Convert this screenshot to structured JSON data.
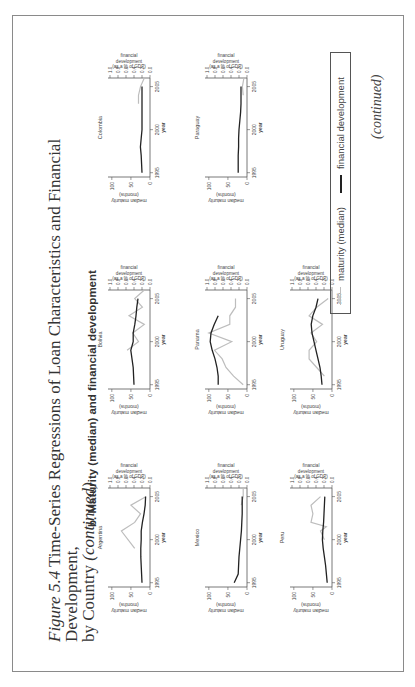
{
  "figure": {
    "title_italic": "Figure 5.4",
    "title_line1": " Time-Series Regressions of Loan Characteristics and Financial Development,",
    "title_line2_prefix": "by Country ",
    "title_line2_italic": "(continued)",
    "subtitle": "b. Maturity (median) and financial development",
    "continued": "(continued)"
  },
  "axes": {
    "left_label_1": "median maturity",
    "left_label_2": "(months)",
    "left_ticks": [
      "0",
      "50",
      "100"
    ],
    "right_label_1": "financial",
    "right_label_2": "development",
    "right_label_3": "(as a % of GDP)",
    "right_ticks": [
      "0.0",
      "0.2",
      "0.4",
      "0.6",
      "0.8",
      "1.0"
    ],
    "x_label": "year",
    "x_ticks": [
      "1995",
      "2000",
      "2005"
    ]
  },
  "legend": {
    "maturity": "maturity (median)",
    "financial": "financial development",
    "maturity_color": "#bdbdbd",
    "financial_color": "#222222"
  },
  "chart_data": {
    "type": "line",
    "xlabel": "year",
    "ylabel_left": "median maturity (months)",
    "ylabel_right": "financial development (as a % of GDP)",
    "xlim": [
      1994.5,
      2006
    ],
    "ylim_left": [
      0,
      110
    ],
    "ylim_right": [
      0,
      1.0
    ],
    "grid": false,
    "legend_position": "bottom",
    "panels": [
      {
        "country": "Argentina",
        "maturity": {
          "x": [
            1999,
            2001,
            2002,
            2003,
            2004,
            2005
          ],
          "y": [
            40,
            75,
            40,
            25,
            50,
            10
          ]
        },
        "financial": {
          "x": [
            1995,
            1996,
            1997,
            1998,
            1999,
            2000,
            2001,
            2002,
            2003,
            2004,
            2005
          ],
          "y": [
            0.2,
            0.21,
            0.22,
            0.23,
            0.23,
            0.22,
            0.22,
            0.19,
            0.15,
            0.12,
            0.11
          ]
        }
      },
      {
        "country": "Bolivia",
        "maturity": {
          "x": [
            1999,
            2000,
            2001,
            2002,
            2003,
            2004,
            2005,
            2006
          ],
          "y": [
            60,
            30,
            45,
            15,
            55,
            20,
            40,
            15
          ]
        },
        "financial": {
          "x": [
            1995,
            1996,
            1997,
            1998,
            1999,
            2000,
            2001,
            2002,
            2003,
            2004,
            2005
          ],
          "y": [
            0.4,
            0.41,
            0.42,
            0.45,
            0.48,
            0.42,
            0.42,
            0.38,
            0.35,
            0.33,
            0.3
          ]
        }
      },
      {
        "country": "Colombia",
        "maturity": {
          "x": [
            2003,
            2004,
            2005,
            2006
          ],
          "y": [
            30,
            30,
            25,
            15
          ]
        },
        "financial": {
          "x": [
            1995,
            1996,
            1997,
            1998,
            1999,
            2000,
            2001,
            2002,
            2003,
            2004,
            2005
          ],
          "y": [
            0.2,
            0.21,
            0.22,
            0.24,
            0.22,
            0.2,
            0.2,
            0.2,
            0.2,
            0.2,
            0.2
          ]
        }
      },
      {
        "country": "Mexico",
        "maturity": {
          "x": [
            2004,
            2005,
            2006
          ],
          "y": [
            15,
            10,
            10
          ]
        },
        "financial": {
          "x": [
            1995,
            1996,
            1997,
            1998,
            1999,
            2000,
            2001,
            2002,
            2003,
            2004,
            2005
          ],
          "y": [
            0.32,
            0.22,
            0.21,
            0.2,
            0.18,
            0.16,
            0.14,
            0.13,
            0.12,
            0.12,
            0.12
          ]
        }
      },
      {
        "country": "Panama",
        "maturity": {
          "x": [
            1995,
            1996,
            1997,
            1998,
            1999,
            2000,
            2001,
            2002,
            2003,
            2004,
            2005
          ],
          "y": [
            10,
            35,
            55,
            65,
            85,
            40,
            100,
            45,
            45,
            30,
            30
          ]
        },
        "financial": {
          "x": [
            1995,
            1996,
            1997,
            1998,
            1999,
            2000,
            2001,
            2002,
            2003
          ],
          "y": [
            0.72,
            0.72,
            0.75,
            0.8,
            0.87,
            0.92,
            0.9,
            0.82,
            0.72
          ]
        }
      },
      {
        "country": "Paraguay",
        "maturity": {
          "x": [
            2004,
            2005,
            2006
          ],
          "y": [
            10,
            12,
            8
          ]
        },
        "financial": {
          "x": [
            1995,
            1996,
            1997,
            1998,
            1999,
            2000,
            2001,
            2002,
            2003,
            2004,
            2005
          ],
          "y": [
            0.22,
            0.22,
            0.22,
            0.21,
            0.21,
            0.2,
            0.18,
            0.16,
            0.15,
            0.15,
            0.15
          ]
        }
      },
      {
        "country": "Peru",
        "maturity": {
          "x": [
            2000,
            2001,
            2001.5,
            2002,
            2003,
            2004,
            2005
          ],
          "y": [
            20,
            30,
            15,
            55,
            50,
            55,
            30
          ]
        },
        "financial": {
          "x": [
            1995,
            1996,
            1997,
            1998,
            1999,
            2000,
            2001,
            2002,
            2003,
            2004,
            2005
          ],
          "y": [
            0.12,
            0.14,
            0.16,
            0.19,
            0.22,
            0.24,
            0.23,
            0.21,
            0.2,
            0.19,
            0.18
          ]
        }
      },
      {
        "country": "Uruguay",
        "maturity": {
          "x": [
            1996,
            1997,
            1998,
            1999,
            2000,
            2001,
            2002,
            2003,
            2004,
            2005
          ],
          "y": [
            20,
            40,
            60,
            60,
            40,
            55,
            25,
            60,
            40,
            10
          ]
        },
        "financial": {
          "x": [
            1995,
            1996,
            1997,
            1998,
            1999,
            2000,
            2001,
            2002,
            2003,
            2004,
            2005
          ],
          "y": [
            0.25,
            0.27,
            0.3,
            0.35,
            0.4,
            0.45,
            0.5,
            0.52,
            0.48,
            0.4,
            0.35
          ]
        }
      }
    ]
  }
}
